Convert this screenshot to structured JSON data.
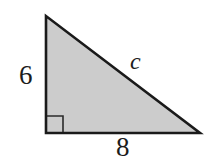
{
  "figure": {
    "kind": "right-triangle-diagram",
    "canvas": {
      "width": 208,
      "height": 158,
      "background": "#ffffff"
    },
    "shape": {
      "name": "right-triangle",
      "fill_color": "#cccccc",
      "stroke_color": "#1a1a1a",
      "stroke_width": 2.6,
      "vertices": {
        "apex": {
          "x": 46,
          "y": 16
        },
        "bottom_left": {
          "x": 46,
          "y": 133
        },
        "bottom_right": {
          "x": 200,
          "y": 133
        }
      },
      "points_attr": "46,16 46,133 200,133"
    },
    "right_angle_marker": {
      "name": "right-angle-square",
      "x": 47,
      "y": 116,
      "size": 16,
      "stroke_color": "#2a2a2a",
      "stroke_width": 1.6,
      "path_attr": "M 47 116 L 63 116 L 63 132"
    },
    "labels": {
      "vertical_leg": "6",
      "horizontal_leg": "8",
      "hypotenuse": "c"
    }
  }
}
